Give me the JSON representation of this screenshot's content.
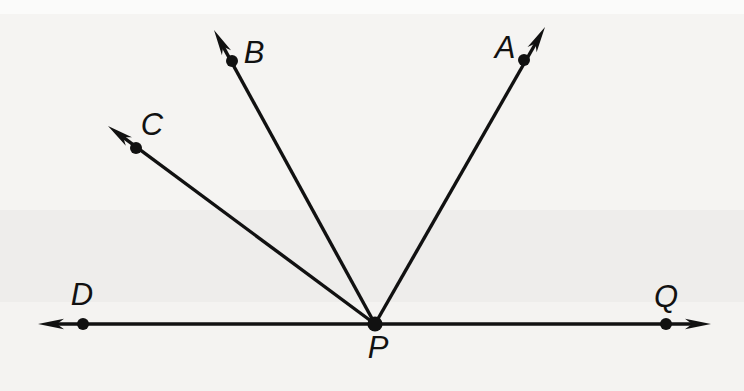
{
  "figure": {
    "type": "geometry-diagram",
    "background_color": "#f3f2f0",
    "ink_color": "#111111",
    "vertex": {
      "name": "P",
      "x": 375,
      "y": 324,
      "label_x": 378,
      "label_y": 363
    },
    "points": [
      {
        "name": "A",
        "dot_x": 524,
        "dot_y": 60,
        "tip_x": 545,
        "tip_y": 27,
        "label_x": 505,
        "label_y": 63
      },
      {
        "name": "B",
        "dot_x": 232,
        "dot_y": 61,
        "tip_x": 214,
        "tip_y": 30,
        "label_x": 254,
        "label_y": 68
      },
      {
        "name": "C",
        "dot_x": 136,
        "dot_y": 148,
        "tip_x": 108,
        "tip_y": 126,
        "label_x": 152,
        "label_y": 140
      },
      {
        "name": "D",
        "dot_x": 83,
        "dot_y": 324,
        "tip_x": 38,
        "tip_y": 324,
        "label_x": 82,
        "label_y": 310
      },
      {
        "name": "Q",
        "dot_x": 666,
        "dot_y": 324,
        "tip_x": 711,
        "tip_y": 324,
        "label_x": 666,
        "label_y": 312
      }
    ],
    "rays": [
      {
        "name": "ray-PA",
        "from": "P",
        "to": "A",
        "angle_deg": 62
      },
      {
        "name": "ray-PB",
        "from": "P",
        "to": "B",
        "angle_deg": 118
      },
      {
        "name": "ray-PC",
        "from": "P",
        "to": "C",
        "angle_deg": 144
      },
      {
        "name": "ray-PD",
        "from": "P",
        "to": "D",
        "angle_deg": 180
      },
      {
        "name": "ray-PQ",
        "from": "P",
        "to": "Q",
        "angle_deg": 0
      }
    ],
    "line_width": 3.4,
    "dot_radius": 6,
    "bleed_text": {
      "line1": "",
      "line2": "",
      "line3": ""
    }
  }
}
